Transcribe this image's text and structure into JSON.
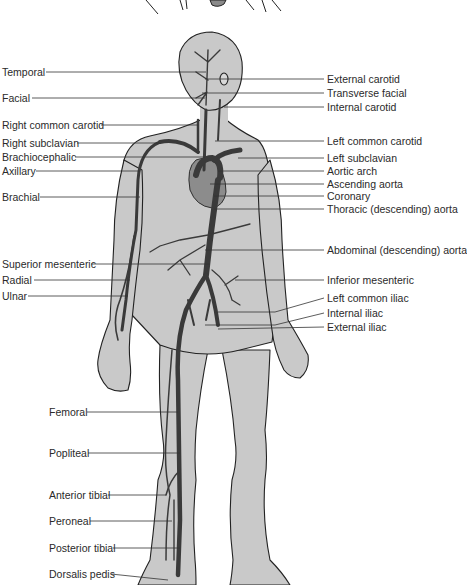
{
  "figure": {
    "colors": {
      "body_fill": "#c9c9c9",
      "outline": "#222222",
      "artery": "#3a3a3a",
      "heart": "#8c8c8c",
      "leader_line": "#333333",
      "background": "#ffffff"
    },
    "labels_left": [
      {
        "text": "Temporal",
        "y": 72,
        "line_to_x": 206
      },
      {
        "text": "Facial",
        "y": 98,
        "line_to_x": 205
      },
      {
        "text": "Right common carotid",
        "y": 125,
        "line_to_x": 198
      },
      {
        "text": "Right subclavian",
        "y": 143,
        "line_to_x": 160
      },
      {
        "text": "Brachiocephalic",
        "y": 157,
        "line_to_x": 205
      },
      {
        "text": "Axillary",
        "y": 171,
        "line_to_x": 140
      },
      {
        "text": "Brachial",
        "y": 197,
        "line_to_x": 140
      },
      {
        "text": "Superior mesenteric",
        "y": 264,
        "line_to_x": 210
      },
      {
        "text": "Radial",
        "y": 280,
        "line_to_x": 130
      },
      {
        "text": "Ulnar",
        "y": 296,
        "line_to_x": 128
      },
      {
        "text": "Femoral",
        "y": 412,
        "line_to_x": 178
      },
      {
        "text": "Popliteal",
        "y": 453,
        "line_to_x": 180
      },
      {
        "text": "Anterior tibial",
        "y": 495,
        "line_to_x": 166
      },
      {
        "text": "Peroneal",
        "y": 521,
        "line_to_x": 172
      },
      {
        "text": "Posterior tibial",
        "y": 548,
        "line_to_x": 180
      },
      {
        "text": "Dorsalis pedis",
        "y": 574,
        "line_to_x": 168
      }
    ],
    "labels_right": [
      {
        "text": "External carotid",
        "y": 79,
        "line_from_x": 205
      },
      {
        "text": "Transverse facial",
        "y": 93,
        "line_from_x": 202
      },
      {
        "text": "Internal carotid",
        "y": 107,
        "line_from_x": 224
      },
      {
        "text": "Left common carotid",
        "y": 141,
        "line_from_x": 215
      },
      {
        "text": "Left subclavian",
        "y": 158,
        "line_from_x": 238
      },
      {
        "text": "Aortic arch",
        "y": 171,
        "line_from_x": 218
      },
      {
        "text": "Ascending aorta",
        "y": 184,
        "line_from_x": 210
      },
      {
        "text": "Coronary",
        "y": 196,
        "line_from_x": 214
      },
      {
        "text": "Thoracic (descending) aorta",
        "y": 209,
        "line_from_x": 214
      },
      {
        "text": "Abdominal (descending) aorta",
        "y": 250,
        "line_from_x": 205
      },
      {
        "text": "Inferior mesenteric",
        "y": 280,
        "line_from_x": 235
      },
      {
        "text": "Left common iliac",
        "y": 298,
        "line_from_x": 218
      },
      {
        "text": "Internal iliac",
        "y": 313,
        "line_from_x": 205
      },
      {
        "text": "External iliac",
        "y": 327,
        "line_from_x": 218
      }
    ]
  }
}
